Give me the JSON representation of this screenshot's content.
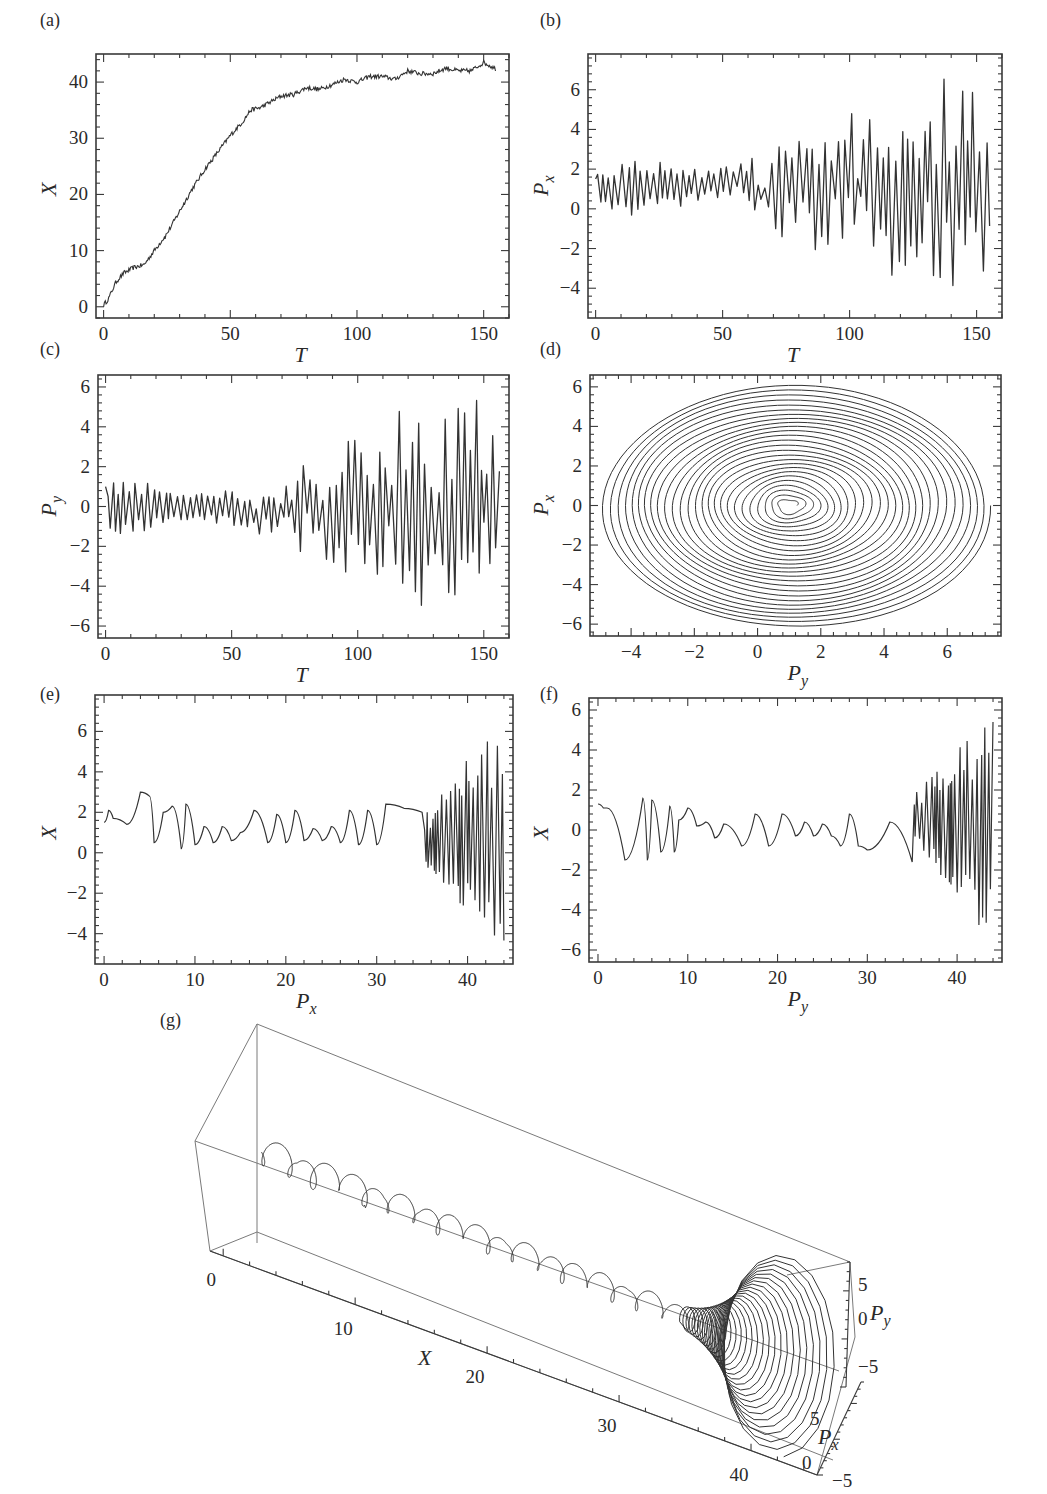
{
  "figure": {
    "line_color": "#333333",
    "frame_color": "#3a3a3a",
    "box3d_color": "#7a7a7a"
  },
  "chart_data": [
    {
      "id": "a",
      "type": "line",
      "panel_label": "(a)",
      "xlabel": "T",
      "ylabel": "X",
      "xlim": [
        -3,
        160
      ],
      "ylim": [
        -2,
        45
      ],
      "xticks": [
        0,
        50,
        100,
        150
      ],
      "yticks": [
        0,
        10,
        20,
        30,
        40
      ],
      "grid": false,
      "description": "Roughly linear rise from 0 to ~35 over T=0–58, then a slow noisy saturation to ~42–43",
      "x": [
        0,
        2,
        5,
        8,
        12,
        16,
        20,
        25,
        30,
        35,
        40,
        45,
        50,
        55,
        58,
        62,
        66,
        70,
        75,
        80,
        85,
        90,
        95,
        100,
        105,
        110,
        115,
        120,
        125,
        130,
        135,
        140,
        145,
        150,
        155
      ],
      "y": [
        0.3,
        1.5,
        4.5,
        6,
        7,
        7.5,
        10,
        13,
        17,
        21,
        24.5,
        27.5,
        30.5,
        33,
        35,
        35.5,
        36.5,
        37.5,
        37.8,
        39,
        38.7,
        39.5,
        40.5,
        40,
        41,
        41,
        40.5,
        42,
        41.5,
        41.5,
        42.5,
        42,
        42,
        43.5,
        42.3
      ]
    },
    {
      "id": "b",
      "type": "line",
      "panel_label": "(b)",
      "xlabel": "P_x",
      "xlabel_axis": "T",
      "ylabel": "P_x",
      "xlim": [
        -3,
        160
      ],
      "ylim": [
        -5.5,
        7.8
      ],
      "xticks": [
        0,
        50,
        100,
        150
      ],
      "yticks": [
        -4,
        -2,
        0,
        2,
        4,
        6
      ],
      "grid": false,
      "description": "Small oscillations between ~0 and ~2.5 until T≈57, then rapidly oscillating with amplitude growing to about +7 / −5 by T=155",
      "envelope": {
        "x": [
          0,
          20,
          40,
          57,
          60,
          80,
          100,
          120,
          140,
          155
        ],
        "upper": [
          2.2,
          2.5,
          2.0,
          2.3,
          2.6,
          3.5,
          5.0,
          6.0,
          6.8,
          7.3
        ],
        "lower": [
          -0.4,
          -0.3,
          0.3,
          0.8,
          -0.9,
          -2.0,
          -2.8,
          -3.8,
          -4.6,
          -5.0
        ]
      }
    },
    {
      "id": "c",
      "type": "line",
      "panel_label": "(c)",
      "xlabel": "T",
      "ylabel": "P_y",
      "xlim": [
        -3,
        160
      ],
      "ylim": [
        -6.6,
        6.6
      ],
      "xticks": [
        0,
        50,
        100,
        150
      ],
      "yticks": [
        -6,
        -4,
        -2,
        0,
        2,
        4,
        6
      ],
      "grid": false,
      "description": "Oscillations within about ±1.5 until T≈58, then a growing oscillation reaching about ±6 at T=155",
      "envelope": {
        "x": [
          0,
          10,
          30,
          50,
          58,
          70,
          90,
          110,
          130,
          155
        ],
        "upper": [
          1.2,
          1.6,
          0.8,
          0.9,
          0.5,
          2.0,
          3.3,
          4.6,
          5.3,
          6.1
        ],
        "lower": [
          -1.3,
          -1.5,
          -0.7,
          -0.9,
          -1.7,
          -2.1,
          -3.3,
          -4.6,
          -5.3,
          -6.1
        ]
      }
    },
    {
      "id": "d",
      "type": "line",
      "panel_label": "(d)",
      "xlabel": "P_y",
      "ylabel": "P_x",
      "xlim": [
        -5.3,
        7.7
      ],
      "ylim": [
        -6.6,
        6.6
      ],
      "xticks": [
        -4,
        -2,
        0,
        2,
        4,
        6
      ],
      "yticks": [
        -6,
        -4,
        -2,
        0,
        2,
        4,
        6
      ],
      "grid": false,
      "description": "Phase portrait: an outward spiral centered near (P_y, P_x) ≈ (1, 0), outermost loop spanning P_y ∈ [-5, 7.4] and P_x ∈ [-6.2, 6.2]",
      "spiral": {
        "center": [
          1.0,
          0.0
        ],
        "max_radius_x": 6.2,
        "max_radius_y": 6.2
      }
    },
    {
      "id": "e",
      "type": "line",
      "panel_label": "(e)",
      "xlabel": "P_x",
      "ylabel": "X",
      "xlim": [
        -1,
        45
      ],
      "ylim": [
        -5.5,
        7.8
      ],
      "xticks": [
        0,
        10,
        20,
        30,
        40
      ],
      "yticks": [
        -4,
        -2,
        0,
        2,
        4,
        6
      ],
      "grid": false,
      "description": "Small wavy oscillations between ~0 and ~3 for horizontal values 0–35, then a dense burst of oscillations from ~35 to 44 spanning −5 to +7",
      "x": [
        0,
        0.5,
        1,
        2.5,
        4,
        5,
        5.5,
        6.5,
        7.5,
        8.5,
        9,
        10,
        11,
        12,
        13,
        14,
        15,
        16.5,
        18,
        19,
        20,
        21,
        22,
        23,
        24,
        25,
        26,
        27,
        28,
        29,
        30,
        31,
        33,
        35
      ],
      "y": [
        1.5,
        2.1,
        1.7,
        1.4,
        3.0,
        2.8,
        0.5,
        2.0,
        2.3,
        0.2,
        2.4,
        0.4,
        1.3,
        0.5,
        1.3,
        0.6,
        1.0,
        2.1,
        0.5,
        1.9,
        0.5,
        2.1,
        0.6,
        1.2,
        0.6,
        1.3,
        0.5,
        2.1,
        0.4,
        2.1,
        0.4,
        2.4,
        2.2,
        2.0
      ],
      "burst": {
        "x_range": [
          35,
          44
        ],
        "y_range": [
          -5.0,
          7.3
        ]
      }
    },
    {
      "id": "f",
      "type": "line",
      "panel_label": "(f)",
      "xlabel": "P_y",
      "ylabel": "X",
      "xlim": [
        -1,
        45
      ],
      "ylim": [
        -6.6,
        6.6
      ],
      "xticks": [
        0,
        10,
        20,
        30,
        40
      ],
      "yticks": [
        -6,
        -4,
        -2,
        0,
        2,
        4,
        6
      ],
      "grid": false,
      "description": "Wavy oscillations mostly within ±1.5 for 0–35, then a dense burst between ~35 and 44 spanning −6 to +6",
      "x": [
        0,
        0.6,
        1,
        3,
        5,
        5.5,
        6,
        7,
        8,
        8.5,
        9,
        10,
        11,
        12,
        13,
        14,
        16,
        17.5,
        19,
        20.5,
        22,
        23,
        24,
        25,
        26,
        27,
        28,
        29,
        30,
        32.5,
        35
      ],
      "y": [
        1.3,
        1.1,
        1.1,
        -1.5,
        1.6,
        -1.5,
        1.5,
        -1.1,
        1.2,
        -1.1,
        0.5,
        1.1,
        0.2,
        0.4,
        -0.4,
        0.3,
        -0.8,
        0.8,
        -0.8,
        0.8,
        -0.3,
        0.4,
        -0.3,
        0.3,
        -0.3,
        -0.8,
        0.8,
        -0.8,
        -1.0,
        0.4,
        -1.6
      ],
      "burst": {
        "x_range": [
          35,
          44
        ],
        "y_range": [
          -6.1,
          6.2
        ]
      }
    },
    {
      "id": "g",
      "type": "line3d",
      "panel_label": "(g)",
      "xlabel": "X",
      "ylabel": "P_x",
      "zlabel": "P_y",
      "x_ticks": [
        0,
        10,
        20,
        30,
        40
      ],
      "px_ticks": [
        -5,
        0,
        5
      ],
      "py_ticks": [
        -5,
        0,
        5
      ],
      "xlim": [
        -1,
        45
      ],
      "pxlim": [
        -6,
        7
      ],
      "pylim": [
        -6,
        7
      ],
      "description": "3D trajectory along X from 0 to ~44: small loops near the axis for X<35, then a widening conical spiral from X≈35 to 44"
    }
  ]
}
